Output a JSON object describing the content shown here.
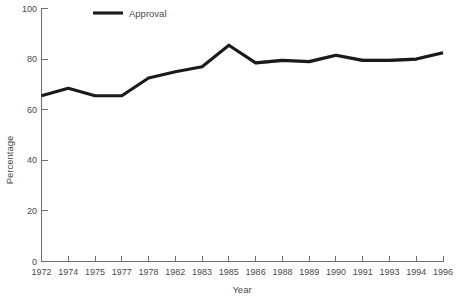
{
  "chart_data": {
    "type": "line",
    "title": "",
    "xlabel": "Year",
    "ylabel": "Percentage",
    "categories": [
      "1972",
      "1974",
      "1975",
      "1977",
      "1978",
      "1982",
      "1983",
      "1985",
      "1986",
      "1988",
      "1989",
      "1990",
      "1991",
      "1993",
      "1994",
      "1996"
    ],
    "series": [
      {
        "name": "Approval",
        "color": "#1a1a1a",
        "values": [
          65.5,
          68.5,
          65.5,
          65.5,
          72.5,
          75.0,
          77.0,
          85.5,
          78.5,
          79.5,
          79.0,
          81.5,
          79.5,
          79.5,
          80.0,
          82.5
        ]
      }
    ],
    "ylim": [
      0,
      100
    ],
    "yticks": [
      "0",
      "20",
      "40",
      "60",
      "80",
      "100"
    ],
    "ytick_values": [
      0,
      20,
      40,
      60,
      80,
      100
    ],
    "grid": false,
    "legend_position": "top-left",
    "legend_entries": [
      "Approval"
    ]
  },
  "axes": {
    "y_title": "Percentage",
    "x_title": "Year"
  },
  "legend": {
    "items": [
      {
        "label": "Approval",
        "color": "#1a1a1a"
      }
    ]
  },
  "colors": {
    "line": "#1a1a1a",
    "axis": "#6d6d6d",
    "text": "#4a4a4a",
    "background": "#ffffff",
    "fringe_green": "#2f9e44",
    "fringe_magenta": "#8d3f6b"
  }
}
